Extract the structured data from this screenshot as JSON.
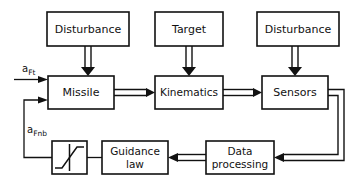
{
  "diagram": {
    "stroke_color": "#111111",
    "background_color": "#ffffff",
    "blocks": [
      {
        "id": "disturbance_left",
        "label": "Disturbance",
        "x": 47,
        "y": 12,
        "w": 82,
        "h": 34
      },
      {
        "id": "target",
        "label": "Target",
        "x": 155,
        "y": 12,
        "w": 68,
        "h": 34
      },
      {
        "id": "disturbance_right",
        "label": "Disturbance",
        "x": 257,
        "y": 12,
        "w": 82,
        "h": 34
      },
      {
        "id": "missile",
        "label": "Missile",
        "x": 48,
        "y": 76,
        "w": 66,
        "h": 33
      },
      {
        "id": "kinematics",
        "label": "Kinematics",
        "x": 155,
        "y": 76,
        "w": 68,
        "h": 33
      },
      {
        "id": "sensors",
        "label": "Sensors",
        "x": 262,
        "y": 76,
        "w": 66,
        "h": 33
      },
      {
        "id": "saturation",
        "label": "",
        "x": 52,
        "y": 141,
        "w": 35,
        "h": 33
      },
      {
        "id": "guidance_law",
        "label": "Guidance law",
        "x": 102,
        "y": 141,
        "w": 66,
        "h": 33
      },
      {
        "id": "data_processing",
        "label": "Data processing",
        "x": 206,
        "y": 141,
        "w": 68,
        "h": 33
      }
    ],
    "block_labels": {
      "disturbance_left": "Disturbance",
      "target": "Target",
      "disturbance_right": "Disturbance",
      "missile": "Missile",
      "kinematics": "Kinematics",
      "sensors": "Sensors",
      "guidance_law_line1": "Guidance",
      "guidance_law_line2": "law",
      "data_processing_line1": "Data",
      "data_processing_line2": "processing",
      "saturation": "saturation-nonlinearity"
    },
    "signals": [
      {
        "id": "a_Ft",
        "base": "a",
        "subscript": "Ft",
        "x": 22,
        "y": 69
      },
      {
        "id": "a_Fnb",
        "base": "a",
        "subscript": "Fnb",
        "x": 27,
        "y": 131
      }
    ],
    "connections": [
      {
        "from": "disturbance_left",
        "to": "missile",
        "style": "double",
        "label": ""
      },
      {
        "from": "target",
        "to": "kinematics",
        "style": "double",
        "label": ""
      },
      {
        "from": "disturbance_right",
        "to": "sensors",
        "style": "double",
        "label": ""
      },
      {
        "from": "missile",
        "to": "kinematics",
        "style": "double",
        "label": ""
      },
      {
        "from": "kinematics",
        "to": "sensors",
        "style": "double",
        "label": ""
      },
      {
        "from": "sensors",
        "to": "data_processing",
        "style": "double",
        "label": ""
      },
      {
        "from": "data_processing",
        "to": "guidance_law",
        "style": "double",
        "label": ""
      },
      {
        "from": "guidance_law",
        "to": "saturation",
        "style": "single",
        "label": ""
      },
      {
        "from": "saturation",
        "to": "missile",
        "style": "single",
        "label": "a_Fnb"
      },
      {
        "from": "input",
        "to": "missile",
        "style": "single",
        "label": "a_Ft"
      }
    ]
  }
}
